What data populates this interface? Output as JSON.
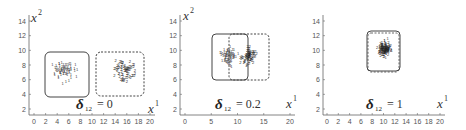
{
  "chart_data": [
    {
      "type": "scatter",
      "title": "δ12 = 0",
      "annotation": {
        "symbol": "δ",
        "subscript": "12",
        "text": "= 0"
      },
      "xlabel": "x",
      "xlabel_sup": "1",
      "ylabel": "x",
      "ylabel_sup": "2",
      "xticks": [
        0,
        2,
        4,
        6,
        8,
        10,
        12,
        14,
        16,
        18,
        20
      ],
      "yticks": [
        2,
        4,
        6,
        8,
        10,
        12,
        14
      ],
      "xlim": [
        0,
        20
      ],
      "ylim": [
        1,
        15
      ],
      "series": [
        {
          "name": "class 1",
          "center": [
            5,
            7
          ],
          "box": {
            "x": [
              2,
              10
            ],
            "y": [
              4,
              10
            ],
            "style": "solid"
          }
        },
        {
          "name": "class 2",
          "center": [
            15.5,
            7
          ],
          "box": {
            "x": [
              11,
              20
            ],
            "y": [
              4,
              10
            ],
            "style": "dashed"
          }
        }
      ],
      "grid": false
    },
    {
      "type": "scatter",
      "title": "δ12 = 0.2",
      "annotation": {
        "symbol": "δ",
        "subscript": "12",
        "text": "= 0.2"
      },
      "xlabel": "x",
      "xlabel_sup": "1",
      "ylabel": "x",
      "ylabel_sup": "2",
      "xticks": [
        0,
        5,
        10,
        15,
        20
      ],
      "yticks": [
        2,
        4,
        6,
        8,
        10,
        12,
        14
      ],
      "xlim": [
        -1,
        21
      ],
      "ylim": [
        1,
        15
      ],
      "series": [
        {
          "name": "class 1",
          "center": [
            8,
            9
          ],
          "box": {
            "x": [
              5,
              12
            ],
            "y": [
              6,
              12
            ],
            "style": "solid"
          }
        },
        {
          "name": "class 2",
          "center": [
            12,
            9
          ],
          "box": {
            "x": [
              8,
              15
            ],
            "y": [
              6,
              12
            ],
            "style": "dashed"
          }
        }
      ],
      "grid": false
    },
    {
      "type": "scatter",
      "title": "δ12 = 1",
      "annotation": {
        "symbol": "δ",
        "subscript": "12",
        "text": "= 1"
      },
      "xlabel": "x",
      "xlabel_sup": "1",
      "ylabel": "",
      "ylabel_sup": "",
      "xticks": [
        0,
        2,
        4,
        6,
        8,
        10,
        12,
        14,
        16,
        18,
        20
      ],
      "yticks": [
        2,
        4,
        6,
        8,
        10,
        12,
        14
      ],
      "xlim": [
        0,
        20
      ],
      "ylim": [
        1,
        15
      ],
      "series": [
        {
          "name": "class 1",
          "center": [
            10,
            10
          ],
          "box": {
            "x": [
              7.5,
              12.5
            ],
            "y": [
              7.5,
              12.5
            ],
            "style": "solid"
          }
        },
        {
          "name": "class 2",
          "center": [
            10,
            10
          ],
          "box": {
            "x": [
              7.5,
              12.5
            ],
            "y": [
              7.5,
              12.5
            ],
            "style": "dashed"
          }
        }
      ],
      "grid": false
    }
  ],
  "panels": [
    {
      "eq": "= 0",
      "sub": "12",
      "delta": "δ",
      "xlab": "x",
      "xsup": "1",
      "ylab": "x",
      "ysup": "2"
    },
    {
      "eq": "= 0.2",
      "sub": "12",
      "delta": "δ",
      "xlab": "x",
      "xsup": "1",
      "ylab": "x",
      "ysup": "2"
    },
    {
      "eq": "= 1",
      "sub": "12",
      "delta": "δ",
      "xlab": "x",
      "xsup": "1"
    }
  ]
}
